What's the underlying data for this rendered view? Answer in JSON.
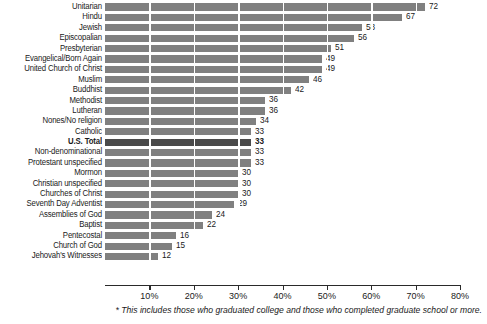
{
  "chart_data": {
    "type": "bar",
    "orientation": "horizontal",
    "title": "",
    "subtitle": "",
    "xlabel": "",
    "ylabel": "",
    "xlim": [
      0,
      80
    ],
    "grid": true,
    "grid_axis": "x",
    "legend": "none",
    "highlight_category": "U.S. Total",
    "categories": [
      "Unitarian",
      "Hindu",
      "Jewish",
      "Episcopalian",
      "Presbyterian",
      "Evangelical/Born Again",
      "United Church of Christ",
      "Muslim",
      "Buddhist",
      "Methodist",
      "Lutheran",
      "Nones/No religion",
      "Catholic",
      "U.S. Total",
      "Non-denominational",
      "Protestant unspecified",
      "Mormon",
      "Christian unspecified",
      "Churches of Christ",
      "Seventh Day Adventist",
      "Assemblies of God",
      "Baptist",
      "Pentecostal",
      "Church of God",
      "Jehovah's Witnesses"
    ],
    "values": [
      72,
      67,
      58,
      56,
      51,
      49,
      49,
      46,
      42,
      36,
      36,
      34,
      33,
      33,
      33,
      33,
      30,
      30,
      30,
      29,
      24,
      22,
      16,
      15,
      12
    ],
    "xticks": [
      10,
      20,
      30,
      40,
      50,
      60,
      70,
      80
    ],
    "xticklabels": [
      "10%",
      "20%",
      "30%",
      "40%",
      "50%",
      "60%",
      "70%",
      "80%"
    ],
    "colors": {
      "bar": "#808080",
      "bar_highlight": "#4a4a4a",
      "gridline": "#ffffff",
      "axis": "#2a2a2a",
      "text": "#1a1a1a",
      "background": "#ffffff"
    }
  },
  "footnote": {
    "text": "* This includes those who graduated college and those who completed graduate school or more."
  }
}
